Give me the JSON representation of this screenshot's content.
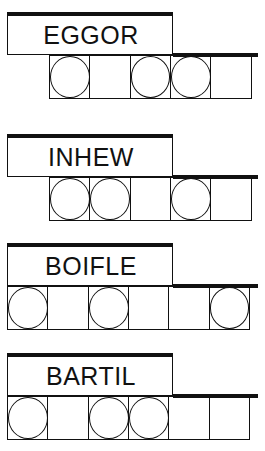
{
  "puzzles": [
    {
      "scrambled": "EGGOR",
      "cell_count": 5,
      "circled": [
        true,
        false,
        true,
        true,
        false
      ],
      "top": 12
    },
    {
      "scrambled": "INHEW",
      "cell_count": 5,
      "circled": [
        true,
        true,
        false,
        true,
        false
      ],
      "top": 134
    },
    {
      "scrambled": "BOIFLE",
      "cell_count": 6,
      "circled": [
        true,
        false,
        true,
        false,
        false,
        true
      ],
      "top": 243
    },
    {
      "scrambled": "BARTIL",
      "cell_count": 6,
      "circled": [
        true,
        false,
        true,
        true,
        false,
        false
      ],
      "top": 353
    }
  ]
}
